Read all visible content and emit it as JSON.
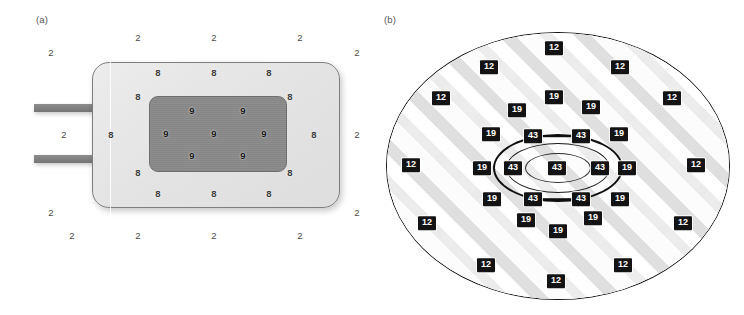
{
  "figure": {
    "width": 744,
    "height": 315,
    "background": "#ffffff",
    "panels": [
      {
        "id": "a",
        "label": "(a)"
      },
      {
        "id": "b",
        "label": "(b)"
      }
    ]
  },
  "colors": {
    "device_body_fill": "#e4e4e4",
    "device_body_stroke": "#7e7e7e",
    "device_core_fill": "#8a8a8a",
    "device_core_stroke": "#6e6e6e",
    "lead_fill": "#808080",
    "tissue_fill": "#fbfbfb",
    "tissue_stroke": "#111111",
    "chip_fill": "#131313",
    "chip_text": "#ffffff",
    "plain_text": "#3c3c3c"
  },
  "panel_a": {
    "label": "(a)",
    "parts": {
      "body_name": "device-body",
      "core_name": "device-core",
      "lead_top_name": "lead-top",
      "lead_bottom_name": "lead-bottom"
    },
    "outside_value": "2",
    "body_value": "8",
    "core_value": "9",
    "outside_labels": [
      {
        "value": "2",
        "x": 51,
        "y": 53
      },
      {
        "value": "2",
        "x": 138,
        "y": 38
      },
      {
        "value": "2",
        "x": 214,
        "y": 38
      },
      {
        "value": "2",
        "x": 300,
        "y": 38
      },
      {
        "value": "2",
        "x": 357,
        "y": 53
      },
      {
        "value": "2",
        "x": 64,
        "y": 135
      },
      {
        "value": "2",
        "x": 357,
        "y": 135
      },
      {
        "value": "2",
        "x": 51,
        "y": 213
      },
      {
        "value": "2",
        "x": 357,
        "y": 213
      },
      {
        "value": "2",
        "x": 72,
        "y": 236
      },
      {
        "value": "2",
        "x": 138,
        "y": 236
      },
      {
        "value": "2",
        "x": 214,
        "y": 236
      },
      {
        "value": "2",
        "x": 300,
        "y": 236
      }
    ],
    "body_labels": [
      {
        "value": "8",
        "x": 158,
        "y": 73
      },
      {
        "value": "8",
        "x": 214,
        "y": 73
      },
      {
        "value": "8",
        "x": 269,
        "y": 73
      },
      {
        "value": "8",
        "x": 138,
        "y": 97
      },
      {
        "value": "8",
        "x": 290,
        "y": 97
      },
      {
        "value": "8",
        "x": 111,
        "y": 135
      },
      {
        "value": "8",
        "x": 314,
        "y": 135
      },
      {
        "value": "8",
        "x": 138,
        "y": 173
      },
      {
        "value": "8",
        "x": 290,
        "y": 173
      },
      {
        "value": "8",
        "x": 158,
        "y": 194
      },
      {
        "value": "8",
        "x": 214,
        "y": 194
      },
      {
        "value": "8",
        "x": 269,
        "y": 194
      }
    ],
    "core_labels": [
      {
        "value": "9",
        "x": 192,
        "y": 111
      },
      {
        "value": "9",
        "x": 243,
        "y": 111
      },
      {
        "value": "9",
        "x": 166,
        "y": 134
      },
      {
        "value": "9",
        "x": 214,
        "y": 134
      },
      {
        "value": "9",
        "x": 264,
        "y": 134
      },
      {
        "value": "9",
        "x": 192,
        "y": 156
      },
      {
        "value": "9",
        "x": 243,
        "y": 156
      }
    ]
  },
  "panel_b": {
    "label": "(b)",
    "parts": {
      "tissue_name": "tissue-ellipse",
      "ring_outer_name": "ring-outer",
      "ring_mid_name": "ring-mid",
      "ring_inner_name": "ring-inner"
    },
    "outer_value": "12",
    "middle_value": "19",
    "core_value": "43",
    "outer_labels": [
      {
        "value": "12",
        "x": 182,
        "y": 48
      },
      {
        "value": "12",
        "x": 117,
        "y": 67
      },
      {
        "value": "12",
        "x": 248,
        "y": 67
      },
      {
        "value": "12",
        "x": 69,
        "y": 98
      },
      {
        "value": "12",
        "x": 300,
        "y": 98
      },
      {
        "value": "12",
        "x": 39,
        "y": 165
      },
      {
        "value": "12",
        "x": 324,
        "y": 165
      },
      {
        "value": "12",
        "x": 55,
        "y": 223
      },
      {
        "value": "12",
        "x": 311,
        "y": 223
      },
      {
        "value": "12",
        "x": 114,
        "y": 265
      },
      {
        "value": "12",
        "x": 251,
        "y": 265
      },
      {
        "value": "12",
        "x": 184,
        "y": 281
      }
    ],
    "middle_labels": [
      {
        "value": "19",
        "x": 182,
        "y": 97
      },
      {
        "value": "19",
        "x": 145,
        "y": 110
      },
      {
        "value": "19",
        "x": 219,
        "y": 107
      },
      {
        "value": "19",
        "x": 119,
        "y": 134
      },
      {
        "value": "19",
        "x": 247,
        "y": 134
      },
      {
        "value": "19",
        "x": 110,
        "y": 168
      },
      {
        "value": "19",
        "x": 255,
        "y": 168
      },
      {
        "value": "19",
        "x": 120,
        "y": 199
      },
      {
        "value": "19",
        "x": 248,
        "y": 199
      },
      {
        "value": "19",
        "x": 154,
        "y": 220
      },
      {
        "value": "19",
        "x": 221,
        "y": 218
      },
      {
        "value": "19",
        "x": 186,
        "y": 231
      }
    ],
    "core_labels": [
      {
        "value": "43",
        "x": 161,
        "y": 136
      },
      {
        "value": "43",
        "x": 209,
        "y": 136
      },
      {
        "value": "43",
        "x": 141,
        "y": 168
      },
      {
        "value": "43",
        "x": 185,
        "y": 168
      },
      {
        "value": "43",
        "x": 228,
        "y": 168
      },
      {
        "value": "43",
        "x": 161,
        "y": 199
      },
      {
        "value": "43",
        "x": 209,
        "y": 199
      }
    ],
    "connectors": [
      {
        "x": 185,
        "y": 136,
        "w": 32
      },
      {
        "x": 185,
        "y": 199,
        "w": 32
      }
    ]
  }
}
